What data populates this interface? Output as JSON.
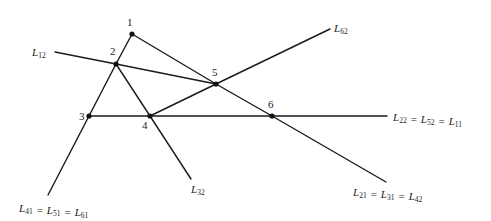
{
  "diagram": {
    "type": "line-intersection-graph",
    "colors": {
      "line": "#1a1a1a",
      "node": "#111111",
      "text": "#222222",
      "background": "#ffffff"
    },
    "nodes": [
      {
        "id": "1",
        "label": "1",
        "x": 132,
        "y": 34,
        "lx": 127,
        "ly": 26
      },
      {
        "id": "2",
        "label": "2",
        "x": 116,
        "y": 64,
        "lx": 110,
        "ly": 55
      },
      {
        "id": "3",
        "label": "3",
        "x": 89,
        "y": 116,
        "lx": 79,
        "ly": 120
      },
      {
        "id": "4",
        "label": "4",
        "x": 150,
        "y": 116,
        "lx": 142,
        "ly": 129
      },
      {
        "id": "5",
        "label": "5",
        "x": 216,
        "y": 84,
        "lx": 212,
        "ly": 76
      },
      {
        "id": "6",
        "label": "6",
        "x": 272,
        "y": 116,
        "lx": 268,
        "ly": 108
      }
    ],
    "lines": [
      {
        "id": "left",
        "points": [
          [
            132,
            34
          ],
          [
            116,
            64
          ],
          [
            89,
            116
          ],
          [
            48,
            195
          ]
        ]
      },
      {
        "id": "diag-1-5-6",
        "points": [
          [
            132,
            34
          ],
          [
            216,
            84
          ],
          [
            272,
            116
          ],
          [
            386,
            182
          ]
        ]
      },
      {
        "id": "L12",
        "points": [
          [
            55,
            52
          ],
          [
            116,
            64
          ],
          [
            216,
            84
          ]
        ]
      },
      {
        "id": "2-4-L32",
        "points": [
          [
            116,
            64
          ],
          [
            150,
            116
          ],
          [
            191,
            179
          ]
        ]
      },
      {
        "id": "4-5-L62",
        "points": [
          [
            150,
            116
          ],
          [
            216,
            84
          ],
          [
            330,
            29
          ]
        ]
      },
      {
        "id": "horizontal",
        "points": [
          [
            89,
            116
          ],
          [
            150,
            116
          ],
          [
            272,
            116
          ],
          [
            387,
            116
          ]
        ]
      }
    ],
    "line_labels": [
      {
        "id": "L12",
        "x": 32,
        "y": 56,
        "terms": [
          {
            "L": "L",
            "sub": "12"
          }
        ]
      },
      {
        "id": "L62",
        "x": 334,
        "y": 32,
        "terms": [
          {
            "L": "L",
            "sub": "62"
          }
        ]
      },
      {
        "id": "L32",
        "x": 191,
        "y": 193,
        "terms": [
          {
            "L": "L",
            "sub": "32"
          }
        ]
      },
      {
        "id": "L22-L52-L11",
        "x": 393,
        "y": 121,
        "terms": [
          {
            "L": "L",
            "sub": "22"
          },
          {
            "L": "L",
            "sub": "52"
          },
          {
            "L": "L",
            "sub": "11"
          }
        ]
      },
      {
        "id": "L21-L31-L42",
        "x": 353,
        "y": 196,
        "terms": [
          {
            "L": "L",
            "sub": "21"
          },
          {
            "L": "L",
            "sub": "31"
          },
          {
            "L": "L",
            "sub": "42"
          }
        ]
      },
      {
        "id": "L41-L51-L61",
        "x": 19,
        "y": 212,
        "terms": [
          {
            "L": "L",
            "sub": "41"
          },
          {
            "L": "L",
            "sub": "51"
          },
          {
            "L": "L",
            "sub": "61"
          }
        ]
      }
    ],
    "equals_sign": "="
  }
}
